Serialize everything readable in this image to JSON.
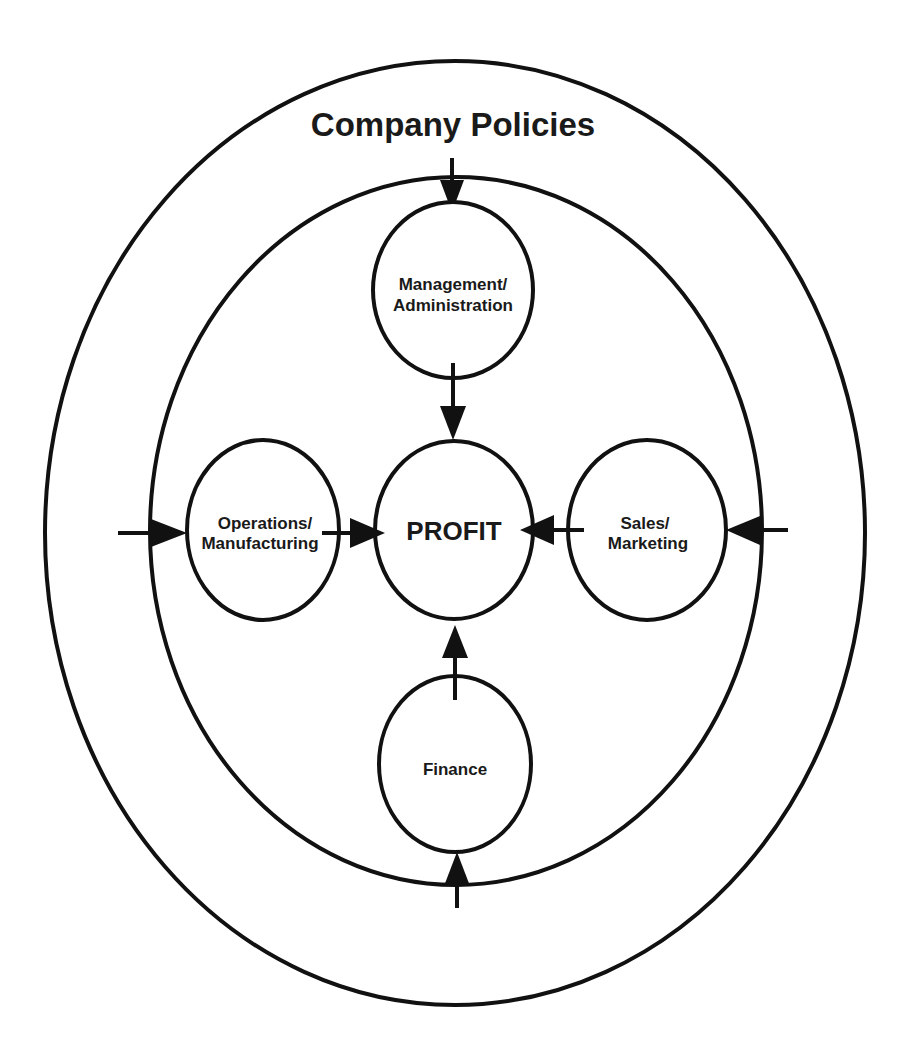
{
  "diagram": {
    "title": "Company Policies",
    "center_node": "PROFIT",
    "nodes": {
      "top": {
        "line1": "Management/",
        "line2": "Administration"
      },
      "left": {
        "line1": "Operations/",
        "line2": "Manufacturing"
      },
      "right": {
        "line1": "Sales/",
        "line2": "Marketing"
      },
      "bottom": {
        "line1": "Finance"
      }
    },
    "colors": {
      "stroke": "#111111",
      "background": "#ffffff",
      "text": "#1a1a1a"
    }
  }
}
